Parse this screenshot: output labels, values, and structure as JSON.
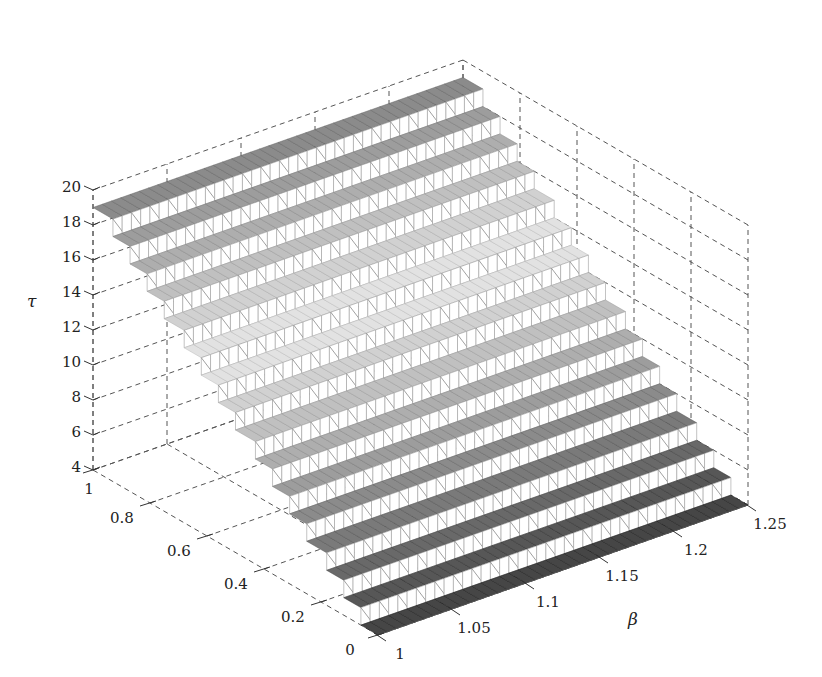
{
  "chart_data": {
    "type": "surface-mesh",
    "title": "",
    "xlabel": "β",
    "ylabel": "",
    "zlabel": "τ",
    "x_axis": {
      "label": "β",
      "range": [
        1,
        1.25
      ],
      "ticks": [
        "1",
        "1.05",
        "1.1",
        "1.15",
        "1.2",
        "1.25"
      ]
    },
    "y_axis": {
      "label": "",
      "range": [
        0,
        1
      ],
      "ticks": [
        "0",
        "0.2",
        "0.4",
        "0.6",
        "0.8",
        "1"
      ]
    },
    "z_axis": {
      "label": "τ",
      "range": [
        4,
        20
      ],
      "ticks": [
        "4",
        "6",
        "8",
        "10",
        "12",
        "14",
        "16",
        "18",
        "20"
      ]
    },
    "grid": true,
    "colormap": "grayscale (dark at low and high τ, light near τ≈12–14)",
    "steps": [
      {
        "y_from": 0.0,
        "y_to": 0.06,
        "tau": 4
      },
      {
        "y_from": 0.06,
        "y_to": 0.12,
        "tau": 5
      },
      {
        "y_from": 0.12,
        "y_to": 0.18,
        "tau": 6
      },
      {
        "y_from": 0.18,
        "y_to": 0.25,
        "tau": 7
      },
      {
        "y_from": 0.25,
        "y_to": 0.31,
        "tau": 8
      },
      {
        "y_from": 0.31,
        "y_to": 0.37,
        "tau": 9
      },
      {
        "y_from": 0.37,
        "y_to": 0.43,
        "tau": 10
      },
      {
        "y_from": 0.43,
        "y_to": 0.5,
        "tau": 11
      },
      {
        "y_from": 0.5,
        "y_to": 0.56,
        "tau": 12
      },
      {
        "y_from": 0.56,
        "y_to": 0.62,
        "tau": 13
      },
      {
        "y_from": 0.62,
        "y_to": 0.68,
        "tau": 14
      },
      {
        "y_from": 0.68,
        "y_to": 0.75,
        "tau": 15
      },
      {
        "y_from": 0.75,
        "y_to": 0.81,
        "tau": 16
      },
      {
        "y_from": 0.81,
        "y_to": 0.87,
        "tau": 17
      },
      {
        "y_from": 0.87,
        "y_to": 0.93,
        "tau": 18
      },
      {
        "y_from": 0.93,
        "y_to": 1.0,
        "tau": 19
      }
    ]
  }
}
